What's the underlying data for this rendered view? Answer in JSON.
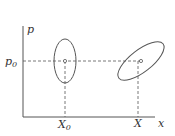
{
  "diagram": {
    "axes": {
      "x_label": "x",
      "y_label": "p"
    },
    "labels": {
      "p0": "p",
      "p0_sub": "0",
      "X0": "X",
      "X0_sub": "0",
      "X": "X"
    },
    "ellipses": [
      {
        "name": "initial-phase-ellipse",
        "cx": 65,
        "cy": 61,
        "rx": 11,
        "ry": 22,
        "rotate": 0
      },
      {
        "name": "evolved-phase-ellipse",
        "cx": 141,
        "cy": 61,
        "rx": 27,
        "ry": 11,
        "rotate": -38
      }
    ],
    "line_color": "#555555"
  }
}
